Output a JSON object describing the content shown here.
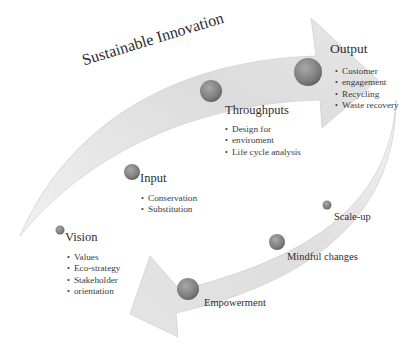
{
  "diagram": {
    "title": "Sustainable Innovation",
    "upper_arrow": {
      "stages": [
        {
          "name": "Vision",
          "items": [
            "Values",
            "Eco-strategy",
            "Stakeholder",
            "orientation"
          ]
        },
        {
          "name": "Input",
          "items": [
            "Conservation",
            "Substitution"
          ]
        },
        {
          "name": "Throughputs",
          "items": [
            "Design for",
            "enviroment",
            "Life cycle analysis"
          ]
        },
        {
          "name": "Output",
          "items": [
            "Customer",
            "engagement",
            "Recycling",
            "Waste recovery"
          ]
        }
      ]
    },
    "lower_arrow": {
      "stages": [
        {
          "name": "Scale-up"
        },
        {
          "name": "Mindful changes"
        },
        {
          "name": "Empowerment"
        }
      ]
    },
    "colors": {
      "arrow_fill": "#dcdcdc",
      "arrow_edge": "#bdbdbd",
      "sphere": "#8a8a8a"
    }
  }
}
